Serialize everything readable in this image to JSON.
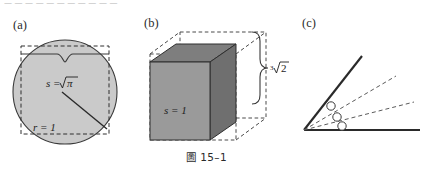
{
  "page": {
    "clipped_header_text": "— — — — — — — — — — —",
    "figure_caption": "圖 15–1",
    "background_color": "#ffffff",
    "ink_color": "#2b2b2b",
    "shading_color": "#c9c9c9",
    "cube_face_color": "#8f8f8f"
  },
  "panels": [
    {
      "id": "a",
      "label": "(a)",
      "name": "squaring-the-circle",
      "labels": {
        "side": "s =",
        "side_value": "√π",
        "radius": "r = 1"
      }
    },
    {
      "id": "b",
      "label": "(b)",
      "name": "doubling-the-cube",
      "labels": {
        "edge": "s = 1",
        "brace": "∛2",
        "brace_index": "3",
        "brace_radicand": "2"
      }
    },
    {
      "id": "c",
      "label": "(c)",
      "name": "trisecting-the-angle",
      "labels": {
        "marker_count": "3"
      }
    }
  ]
}
